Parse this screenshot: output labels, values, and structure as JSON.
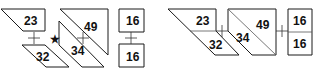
{
  "diagram": {
    "left_group": {
      "pieces": [
        {
          "id": "piece-23",
          "label": "23",
          "points": "1,9 45,9 45,31 23,31",
          "lx": 24,
          "ly": 25
        },
        {
          "id": "piece-32",
          "label": "32",
          "points": "22,45 45,45 69,67 46,67",
          "lx": 36,
          "ly": 61
        },
        {
          "id": "piece-49",
          "label": "49",
          "points": "60,9 108,9 108,55",
          "lx": 84,
          "ly": 31
        },
        {
          "id": "piece-34",
          "label": "34",
          "points": "59,21 104,67 82,67 59,45",
          "lx": 71,
          "ly": 55
        },
        {
          "id": "piece-16-top",
          "label": "16",
          "points": "119,9 144,9 144,32 119,32",
          "lx": 126,
          "ly": 25
        },
        {
          "id": "piece-16-bottom",
          "label": "16",
          "points": "119,44 144,44 144,67 119,67",
          "lx": 126,
          "ly": 61
        }
      ],
      "plus_signs": [
        {
          "id": "plus-left",
          "x": 34,
          "y": 38
        },
        {
          "id": "plus-middle",
          "x": 83,
          "y": 38
        },
        {
          "id": "plus-right",
          "x": 131,
          "y": 38
        }
      ],
      "star": {
        "symbol": "★",
        "x": 50,
        "y": 43
      }
    },
    "right_group": {
      "pieces": [
        {
          "id": "combo-23-32",
          "outline": "168,9 216,9 216,31 239,55 215,55",
          "divider": "190,31 216,31",
          "labels": [
            {
              "text": "23",
              "x": 196,
              "y": 25
            },
            {
              "text": "32",
              "x": 209,
              "y": 49
            }
          ]
        },
        {
          "id": "combo-34-49",
          "outline": "228,9 276,9 276,55 252,55 228,31",
          "divider": "228,9 276,55",
          "labels": [
            {
              "text": "49",
              "x": 256,
              "y": 29
            },
            {
              "text": "34",
              "x": 236,
              "y": 42
            }
          ]
        },
        {
          "id": "combo-16-16",
          "outline": "288,9 312,9 312,55 288,55",
          "divider": "288,32 312,32",
          "labels": [
            {
              "text": "16",
              "x": 293,
              "y": 25
            },
            {
              "text": "16",
              "x": 293,
              "y": 48
            }
          ]
        }
      ],
      "plus_signs": [
        {
          "id": "plus-combo-1",
          "x": 222,
          "y": 31
        },
        {
          "id": "plus-combo-2",
          "x": 282,
          "y": 31
        }
      ]
    }
  }
}
